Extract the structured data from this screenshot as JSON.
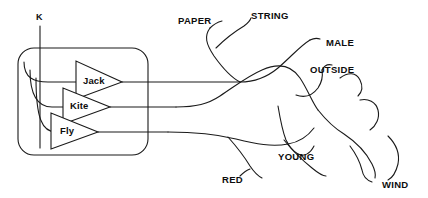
{
  "diagram": {
    "type": "tangled-lines-puzzle",
    "title_label": "K",
    "inner_nodes": [
      {
        "id": "jack",
        "label": "Jack",
        "x": 97,
        "y": 80
      },
      {
        "id": "kite",
        "label": "Kite",
        "x": 84,
        "y": 105
      },
      {
        "id": "fly",
        "label": "Fly",
        "x": 72,
        "y": 131
      }
    ],
    "outer_labels": [
      {
        "id": "paper",
        "label": "PAPER",
        "x": 180,
        "y": 17
      },
      {
        "id": "string",
        "label": "STRING",
        "x": 249,
        "y": 11
      },
      {
        "id": "male",
        "label": "MALE",
        "x": 326,
        "y": 40
      },
      {
        "id": "outside",
        "label": "OUTSIDE",
        "x": 312,
        "y": 67
      },
      {
        "id": "young",
        "label": "YOUNG",
        "x": 276,
        "y": 155
      },
      {
        "id": "red",
        "label": "RED",
        "x": 224,
        "y": 178
      },
      {
        "id": "wind",
        "label": "WIND",
        "x": 382,
        "y": 181
      }
    ],
    "box": {
      "x": 18,
      "y": 48,
      "width": 130,
      "height": 107,
      "radius": 16
    },
    "stroke_color": "#1a1a1a",
    "background_color": "#ffffff"
  }
}
